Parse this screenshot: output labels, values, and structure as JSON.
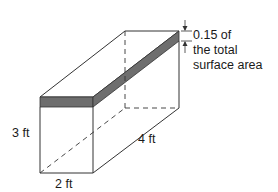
{
  "figure": {
    "type": "rectangular-prism",
    "shaded_band_color": "#6e6e6e",
    "line_color": "#333333",
    "labels": {
      "height": "3 ft",
      "width": "2 ft",
      "length": "4 ft"
    },
    "annotation": {
      "line1": "0.15 of",
      "line2": "the total",
      "line3": "surface area"
    }
  }
}
